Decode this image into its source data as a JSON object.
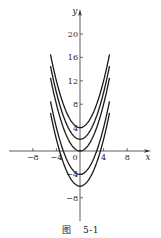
{
  "chart_data": {
    "type": "line",
    "title": "",
    "caption": "图 5-1",
    "caption_parts": {
      "prefix": "图",
      "number": "5-1"
    },
    "xlabel": "x",
    "ylabel": "y",
    "xlim": [
      -12,
      12
    ],
    "ylim": [
      -12,
      24
    ],
    "x_ticks": [
      -8,
      -4,
      0,
      4,
      8
    ],
    "y_ticks": [
      20,
      16,
      12,
      8,
      4,
      -4,
      -8
    ],
    "x_tick_labels": [
      "-8",
      "-4",
      "0",
      "4",
      "8"
    ],
    "y_tick_labels": [
      "20",
      "16",
      "12",
      "8",
      "4",
      "-4",
      "-8"
    ],
    "grid": false,
    "legend": null,
    "series": [
      {
        "name": "C=4",
        "formula": "y = x^2/2 + 4",
        "C": 4,
        "x_range": [
          -5,
          5
        ]
      },
      {
        "name": "C=2",
        "formula": "y = x^2/2 + 2",
        "C": 2,
        "x_range": [
          -5,
          5
        ]
      },
      {
        "name": "C=0",
        "formula": "y = x^2/2",
        "C": 0,
        "x_range": [
          -5,
          5
        ]
      },
      {
        "name": "C=-4",
        "formula": "y = x^2/2 - 4",
        "C": -4,
        "x_range": [
          -5,
          5
        ]
      },
      {
        "name": "C=-6",
        "formula": "y = x^2/2 - 6",
        "C": -6,
        "x_range": [
          -5,
          5
        ]
      }
    ],
    "style": {
      "line_color": "#1a1a1a",
      "axis_color": "#333333",
      "background": "#ffffff"
    }
  }
}
